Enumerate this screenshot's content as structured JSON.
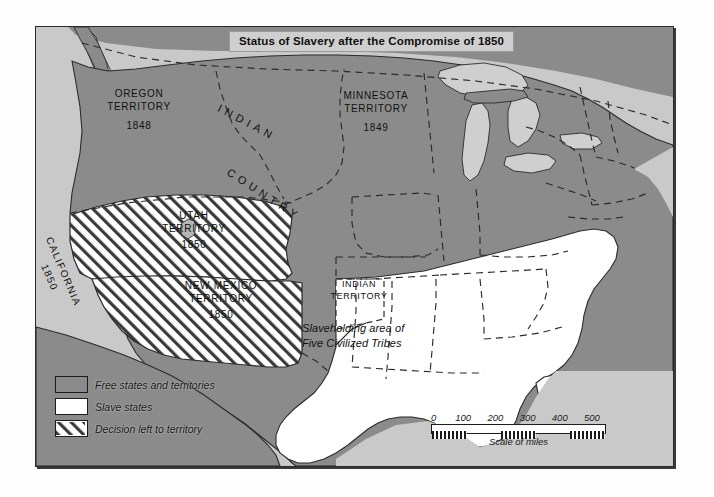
{
  "map": {
    "title": "Status of Slavery after the Compromise of 1850",
    "legend": {
      "items": [
        {
          "swatch": "free",
          "label": "Free states and territories"
        },
        {
          "swatch": "slave",
          "label": "Slave states"
        },
        {
          "swatch": "open",
          "label": "Decision left to territory"
        }
      ]
    },
    "scale": {
      "ticks": [
        "0",
        "100",
        "200",
        "300",
        "400",
        "500"
      ],
      "caption": "Scale of miles"
    },
    "labels": {
      "oregon_name": "OREGON",
      "oregon_type": "TERRITORY",
      "oregon_year": "1848",
      "minnesota_name": "MINNESOTA",
      "minnesota_type": "TERRITORY",
      "minnesota_year": "1849",
      "utah_name": "UTAH",
      "utah_type": "TERRITORY",
      "utah_year": "1850",
      "new_mexico_name": "NEW MEXICO",
      "new_mexico_type": "TERRITORY",
      "new_mexico_year": "1850",
      "california_name": "CALIFORNIA",
      "california_year": "1850",
      "indian_country_line1": "INDIAN",
      "indian_country_line2": "COUNTRY",
      "indian_territory_line1": "INDIAN",
      "indian_territory_line2": "TERRITORY",
      "annotation_line1": "Slaveholding area of",
      "annotation_line2": "Five Civilized Tribes"
    },
    "colors": {
      "free": "#8b8b8b",
      "slave": "#ffffff",
      "water": "#c9c9c9",
      "hatch_line": "#3a3a3a",
      "border": "#1b1b1b",
      "title_box": "#cfcfcf"
    }
  }
}
